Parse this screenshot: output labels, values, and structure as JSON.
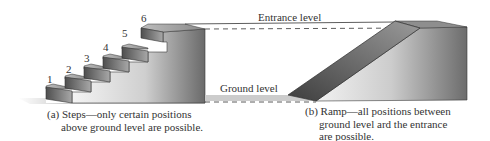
{
  "figure": {
    "steps": {
      "step_labels": [
        "1",
        "2",
        "3",
        "4",
        "5",
        "6"
      ],
      "caption_line1": "(a) Steps—only certain positions",
      "caption_line2": "above ground level are possible."
    },
    "ramp": {
      "caption_line1": "(b) Ramp—all positions between",
      "caption_line2": "ground level ard the entrance",
      "caption_line3": "are possible."
    },
    "levels": {
      "entrance_label": "Entrance level",
      "ground_label": "Ground level"
    },
    "colors": {
      "riser_dark": "#5a5a5a",
      "riser_light": "#9a9a9a",
      "block_light": "#eeeeee",
      "block_dark": "#6e6e6e",
      "ground_shadow": "#c8c8c8",
      "line": "#333333"
    }
  }
}
